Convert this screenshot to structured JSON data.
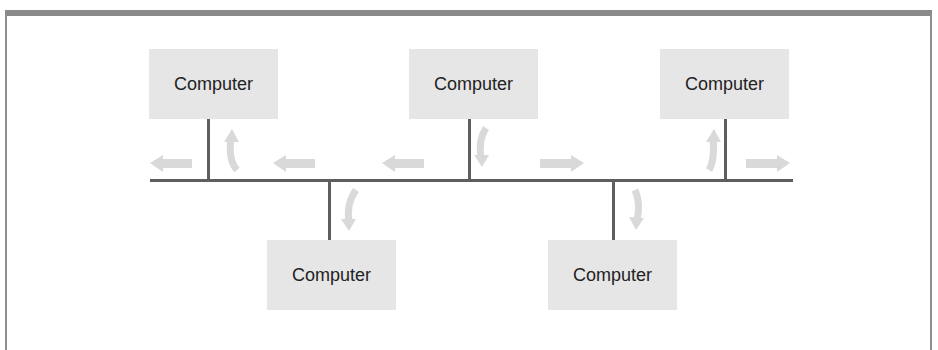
{
  "diagram": {
    "type": "bus-network-topology",
    "nodes": [
      {
        "id": "top-left",
        "label": "Computer",
        "x": 149,
        "y": 49,
        "tap_x": 208,
        "side": "top"
      },
      {
        "id": "top-center",
        "label": "Computer",
        "x": 409,
        "y": 49,
        "tap_x": 469,
        "side": "top"
      },
      {
        "id": "top-right",
        "label": "Computer",
        "x": 660,
        "y": 49,
        "tap_x": 725,
        "side": "top"
      },
      {
        "id": "bottom-left",
        "label": "Computer",
        "x": 267,
        "y": 240,
        "tap_x": 329,
        "side": "bottom"
      },
      {
        "id": "bottom-right",
        "label": "Computer",
        "x": 548,
        "y": 240,
        "tap_x": 613,
        "side": "bottom"
      }
    ],
    "bus": {
      "x1": 150,
      "x2": 792,
      "y": 180
    },
    "signal_arrows": [
      {
        "direction": "left",
        "x": 168
      },
      {
        "direction": "up-from-bus",
        "near": "top-left"
      },
      {
        "direction": "left",
        "x": 290
      },
      {
        "direction": "left",
        "x": 400
      },
      {
        "direction": "down-to-bus",
        "near": "top-center"
      },
      {
        "direction": "right",
        "x": 555
      },
      {
        "direction": "up-from-bus",
        "near": "top-right"
      },
      {
        "direction": "right",
        "x": 775
      },
      {
        "direction": "down-from-bus",
        "near": "bottom-left"
      },
      {
        "direction": "down-from-bus",
        "near": "bottom-right"
      }
    ],
    "colors": {
      "node_fill": "#e6e6e6",
      "line": "#5e5e5e",
      "arrow": "#d9d9d9",
      "frame": "#8a8a8a"
    }
  }
}
